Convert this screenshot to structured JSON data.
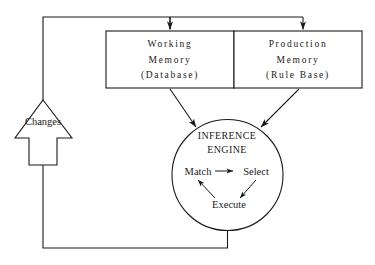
{
  "diagram": {
    "background_color": "#ffffff",
    "line_color": "#1a1a1a",
    "boxes": [
      {
        "id": "working-memory",
        "lines": [
          "Working",
          "Memory",
          "(Database)"
        ]
      },
      {
        "id": "production-memory",
        "lines": [
          "Production",
          "Memory",
          "(Rule Base)"
        ]
      }
    ],
    "engine": {
      "title_lines": [
        "INFERENCE",
        "ENGINE"
      ],
      "cycle": [
        {
          "id": "match",
          "label": "Match"
        },
        {
          "id": "select",
          "label": "Select"
        },
        {
          "id": "execute",
          "label": "Execute"
        }
      ]
    },
    "feedback": {
      "label": "Changes"
    }
  }
}
